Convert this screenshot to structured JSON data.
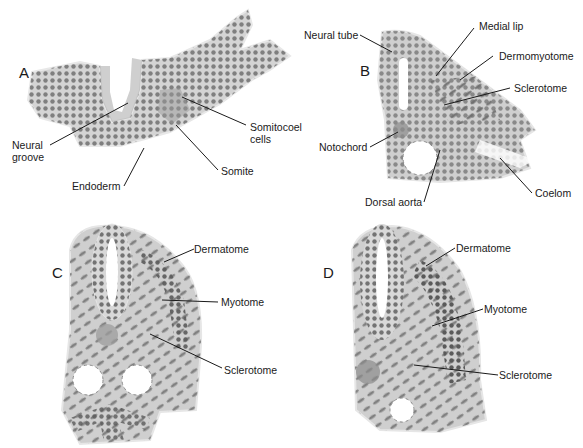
{
  "panels": [
    {
      "letter": "A",
      "labels": {
        "neural_groove_1": "Neural",
        "neural_groove_2": "groove",
        "endoderm": "Endoderm",
        "somite": "Somite",
        "somitocoel_1": "Somitocoel",
        "somitocoel_2": "cells"
      }
    },
    {
      "letter": "B",
      "labels": {
        "neural_tube": "Neural tube",
        "medial_lip": "Medial lip",
        "dermomyotome": "Dermomyotome",
        "sclerotome": "Sclerotome",
        "notochord": "Notochord",
        "dorsal_aorta": "Dorsal aorta",
        "coelom": "Coelom"
      }
    },
    {
      "letter": "C",
      "labels": {
        "dermatome": "Dermatome",
        "myotome": "Myotome",
        "sclerotome": "Sclerotome"
      }
    },
    {
      "letter": "D",
      "labels": {
        "dermatome": "Dermatome",
        "myotome": "Myotome",
        "sclerotome": "Sclerotome"
      }
    }
  ],
  "colors": {
    "tissue_fill": "#c9c9c9",
    "tissue_light": "#dedede",
    "nucleus": "#5a5a5a",
    "leader_line": "#1a1a1a"
  }
}
